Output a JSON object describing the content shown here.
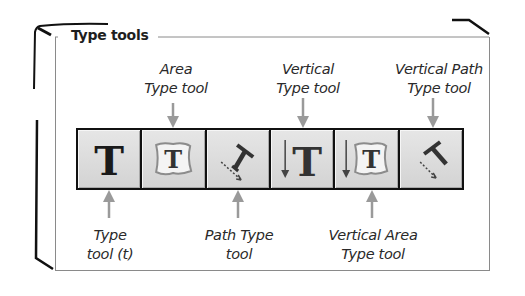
{
  "panel": {
    "title": "Type tools"
  },
  "toolbar": {
    "tools": [
      {
        "name": "Type tool",
        "icon": "type-icon",
        "shortcut": "t"
      },
      {
        "name": "Area Type tool",
        "icon": "area-type-icon"
      },
      {
        "name": "Path Type tool",
        "icon": "path-type-icon"
      },
      {
        "name": "Vertical Type tool",
        "icon": "vertical-type-icon"
      },
      {
        "name": "Vertical Area Type tool",
        "icon": "vertical-area-type-icon"
      },
      {
        "name": "Vertical Path Type tool",
        "icon": "vertical-path-type-icon"
      }
    ]
  },
  "callouts": {
    "top": [
      {
        "line1": "Area",
        "line2": "Type tool"
      },
      {
        "line1": "Vertical",
        "line2": "Type tool"
      },
      {
        "line1": "Vertical Path",
        "line2": "Type tool"
      }
    ],
    "bottom": [
      {
        "line1": "Type",
        "line2": "tool (t)"
      },
      {
        "line1": "Path Type",
        "line2": "tool"
      },
      {
        "line1": "Vertical Area",
        "line2": "Type tool"
      }
    ]
  },
  "colors": {
    "arrow": "#9a9a9a",
    "button_face": "#dcdcdc",
    "toolbar_border": "#111111",
    "panel_border": "#8a8a8a"
  }
}
